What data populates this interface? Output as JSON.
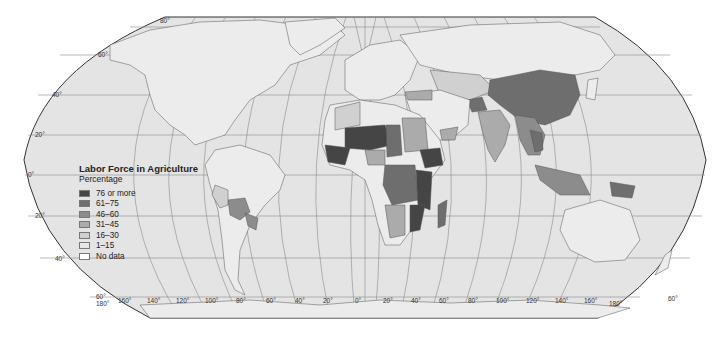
{
  "map": {
    "title": "Labor Force in Agriculture",
    "subtitle": "Percentage",
    "projection": "Robinson",
    "ocean_color": "#e4e4e4",
    "land_base_color": "#ececec",
    "outline_color": "#333333",
    "graticule_color": "#8a8a8a"
  },
  "legend": {
    "items": [
      {
        "label": "76 or more",
        "color": "#454545"
      },
      {
        "label": "61–75",
        "color": "#6e6e6e"
      },
      {
        "label": "46–60",
        "color": "#8c8c8c"
      },
      {
        "label": "31–45",
        "color": "#ababab"
      },
      {
        "label": "16–30",
        "color": "#d0d0d0"
      },
      {
        "label": "1–15",
        "color": "#e6e6e6"
      },
      {
        "label": "No data",
        "color": "#ffffff"
      }
    ]
  },
  "latitude_labels": [
    "80°",
    "60°",
    "40°",
    "20°",
    "0°",
    "20°",
    "40°",
    "60°"
  ],
  "longitude_labels": [
    "180°",
    "160°",
    "140°",
    "120°",
    "100°",
    "80°",
    "60°",
    "40°",
    "20°",
    "0°",
    "20°",
    "40°",
    "60°",
    "80°",
    "100°",
    "120°",
    "140°",
    "160°",
    "180°"
  ],
  "corner_labels": {
    "bottom_left": "60°",
    "bottom_right": "60°"
  }
}
